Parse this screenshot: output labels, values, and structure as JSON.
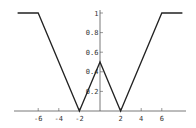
{
  "chart_data": {
    "type": "line",
    "title": "",
    "xlabel": "",
    "ylabel": "",
    "xlim": [
      -8.2,
      8.4
    ],
    "ylim": [
      0,
      1
    ],
    "grid": false,
    "legend": null,
    "series": [
      {
        "name": "piecewise",
        "x": [
          -8,
          -6,
          -2,
          0,
          2,
          6,
          8
        ],
        "y": [
          1,
          1,
          0,
          0.5,
          0,
          1,
          1
        ]
      }
    ],
    "x_ticks": [
      -6,
      -4,
      -2,
      2,
      4,
      6
    ],
    "x_tick_labels": [
      "-6",
      "-4",
      "-2",
      "2",
      "4",
      "6"
    ],
    "y_ticks": [
      0.2,
      0.4,
      0.6,
      0.8,
      1
    ],
    "y_tick_labels": [
      "0.2",
      "0.4",
      "0.6",
      "0.8",
      "1"
    ]
  },
  "colors": {
    "line": "#222222",
    "axis": "#555555"
  }
}
